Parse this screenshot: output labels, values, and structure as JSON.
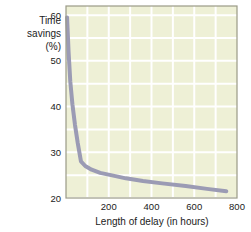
{
  "chart_data": {
    "type": "line",
    "title": "",
    "xlabel": "Length of delay (in hours)",
    "ylabel": "Time savings (%)",
    "ylabel_lines": [
      "Time",
      "savings",
      "(%)"
    ],
    "xlim": [
      0,
      800
    ],
    "ylim": [
      20,
      62
    ],
    "xticks": [
      200,
      400,
      600,
      800
    ],
    "xtick_labels": [
      "200",
      "400",
      "600",
      "800"
    ],
    "yticks": [
      20,
      30,
      40,
      50,
      60
    ],
    "ytick_labels": [
      "20",
      "30",
      "40",
      "50",
      "60"
    ],
    "grid": true,
    "grid_color": "#ffffff",
    "plot_background": "#eef0d6",
    "frame_color": "#9a9a86",
    "legend": null,
    "series": [
      {
        "name": "Time savings vs length of delay",
        "color": "#9b9bb4",
        "line_width": 4,
        "x": [
          5,
          12,
          20,
          30,
          42,
          55,
          70,
          90,
          120,
          160,
          210,
          280,
          360,
          450,
          560,
          660,
          750
        ],
        "y": [
          59.5,
          52.0,
          45.5,
          40.5,
          36.0,
          32.0,
          28.0,
          27.0,
          26.2,
          25.5,
          25.0,
          24.3,
          23.7,
          23.2,
          22.6,
          22.0,
          21.5
        ]
      }
    ]
  },
  "axes": {
    "x_axis_title": "Length of delay (in hours)",
    "y_axis_title_lines": [
      "Time",
      "savings",
      "(%)"
    ]
  }
}
